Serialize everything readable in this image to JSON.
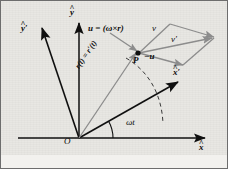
{
  "figure": {
    "type": "physics-vector-diagram",
    "background_color": "#e8e7e3",
    "ink_color": "#0c0c0c",
    "accent_color": "#8a8a8a",
    "width": 228,
    "height": 169
  },
  "axes": {
    "fixed_x": {
      "label": "x",
      "hat": "^",
      "prime": ""
    },
    "fixed_y": {
      "label": "y",
      "hat": "^",
      "prime": ""
    },
    "rotating_x": {
      "label": "x",
      "hat": "^",
      "prime": "′"
    },
    "rotating_y": {
      "label": "y",
      "hat": "^",
      "prime": "′"
    },
    "origin": {
      "label": "O"
    }
  },
  "annotations": {
    "angle": {
      "label": "ωt"
    },
    "position_vector": {
      "label": "r(t) = r′(t)"
    },
    "u_vector": {
      "label": "u = (ω×r)"
    },
    "minus_u_vector": {
      "label": "−u"
    },
    "v_vector": {
      "label": "v"
    },
    "v_prime_vector": {
      "label": "v′"
    },
    "point": {
      "label": "P"
    }
  },
  "elements": {
    "circular_path": "dashed-arc",
    "parallelogram": "velocity-addition-parallelogram"
  }
}
